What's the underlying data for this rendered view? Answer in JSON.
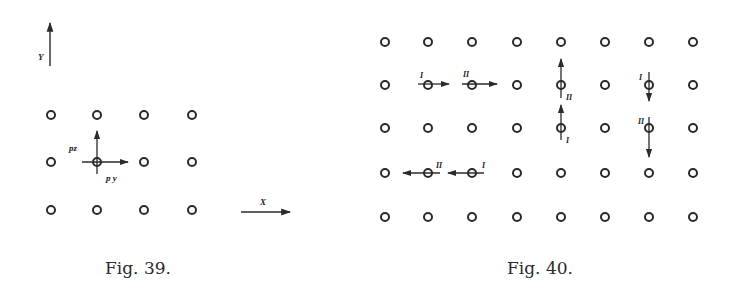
{
  "figures": [
    {
      "id": "fig39",
      "caption": "Fig. 39.",
      "axes": {
        "y_label": "Y",
        "x_label": "X"
      },
      "lattice": {
        "cols": [
          51,
          97,
          144,
          192
        ],
        "rows": [
          115,
          162,
          210
        ]
      },
      "highlighted_site": {
        "col": 1,
        "row": 1
      },
      "vectors": [
        {
          "label": "pz",
          "direction": "up"
        },
        {
          "label": "py",
          "direction": "right"
        }
      ]
    },
    {
      "id": "fig40",
      "caption": "Fig. 40.",
      "lattice": {
        "cols": [
          385,
          428,
          472,
          517,
          561,
          605,
          649,
          693
        ],
        "rows": [
          42,
          85,
          128,
          173,
          217
        ]
      },
      "displacements": [
        {
          "col": 1,
          "row": 1,
          "direction": "right",
          "label": "I"
        },
        {
          "col": 2,
          "row": 1,
          "direction": "right",
          "label": "II"
        },
        {
          "col": 4,
          "row": 1,
          "direction": "up",
          "label": "II"
        },
        {
          "col": 4,
          "row": 2,
          "direction": "up",
          "label": "I"
        },
        {
          "col": 6,
          "row": 1,
          "direction": "down",
          "label": "I"
        },
        {
          "col": 6,
          "row": 2,
          "direction": "down",
          "label": "II"
        },
        {
          "col": 1,
          "row": 3,
          "direction": "left",
          "label": "II"
        },
        {
          "col": 2,
          "row": 3,
          "direction": "left",
          "label": "I"
        }
      ]
    }
  ],
  "colors": {
    "ink": "#2a2a2a",
    "background": "#ffffff"
  }
}
